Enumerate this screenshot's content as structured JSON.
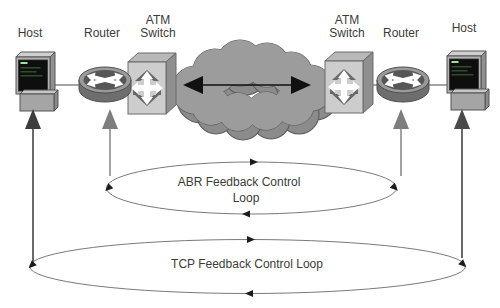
{
  "nodes": {
    "host_left": {
      "label": "Host"
    },
    "router_left": {
      "label": "Router"
    },
    "atm_left": {
      "line1": "ATM",
      "line2": "Switch"
    },
    "atm_right": {
      "line1": "ATM",
      "line2": "Switch"
    },
    "router_right": {
      "label": "Router"
    },
    "host_right": {
      "label": "Host"
    }
  },
  "loops": {
    "abr": {
      "line1": "ABR Feedback Control",
      "line2": "Loop"
    },
    "tcp": {
      "label": "TCP Feedback Control Loop"
    }
  },
  "icons": {
    "host": "workstation-icon",
    "router": "router-icon",
    "atm": "atm-switch-icon",
    "cloud": "network-cloud-icon"
  },
  "colors": {
    "background": "#ffffff",
    "cloud": "#9c9c9c",
    "cloud_shadow": "#8b8b8b",
    "device_face": "#cdcdcd",
    "loop_stroke": "#7a7a7a",
    "arrow_dark": "#3d3d3d",
    "arrow_gray": "#7e7e7e",
    "text": "#3b3b3b"
  }
}
